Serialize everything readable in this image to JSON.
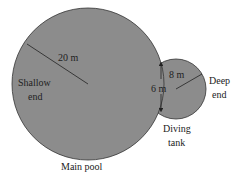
{
  "diagram": {
    "main_pool": {
      "label": "Main pool",
      "radius_label": "20 m",
      "end_label_line1": "Shallow",
      "end_label_line2": "end"
    },
    "diving_tank": {
      "label_line1": "Diving",
      "label_line2": "tank",
      "radius_label": "8 m",
      "chord_label": "6 m",
      "end_label_line1": "Deep",
      "end_label_line2": "end"
    },
    "colors": {
      "fill": "#8c8c8c",
      "stroke": "#333333"
    }
  }
}
